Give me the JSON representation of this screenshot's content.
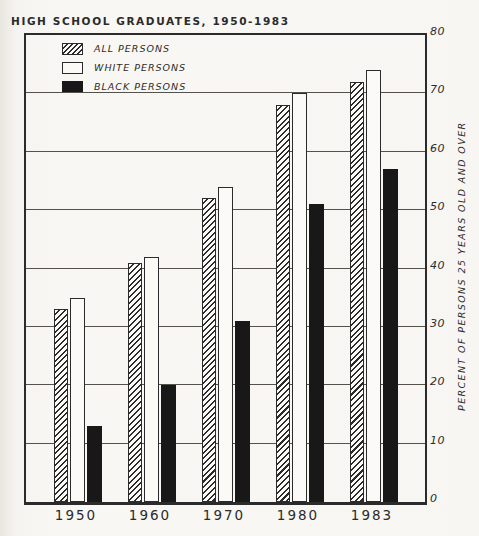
{
  "title": "HIGH SCHOOL GRADUATES, 1950-1983",
  "y_axis": {
    "label": "PERCENT OF PERSONS 25 YEARS OLD AND OVER",
    "ticks": [
      0,
      10,
      20,
      30,
      40,
      50,
      60,
      70,
      80
    ]
  },
  "x_axis": {
    "labels": [
      "1950",
      "1960",
      "1970",
      "1980",
      "1983"
    ]
  },
  "chart_data": {
    "type": "bar",
    "title": "HIGH SCHOOL GRADUATES, 1950-1983",
    "categories": [
      "1950",
      "1960",
      "1970",
      "1980",
      "1983"
    ],
    "series": [
      {
        "name": "ALL PERSONS",
        "style": "hatched",
        "values": [
          33,
          41,
          52,
          68,
          72
        ]
      },
      {
        "name": "WHITE PERSONS",
        "style": "white",
        "values": [
          35,
          42,
          54,
          70,
          74
        ]
      },
      {
        "name": "BLACK PERSONS",
        "style": "black",
        "values": [
          13,
          20,
          31,
          51,
          57
        ]
      }
    ],
    "xlabel": "",
    "ylabel": "PERCENT OF PERSONS 25 YEARS OLD AND OVER",
    "ylim": [
      0,
      80
    ],
    "ytick_step": 10,
    "grid": true,
    "legend_position": "top-left"
  },
  "colors": {
    "ink": "#2b2b2b",
    "paper": "#f7f6f2",
    "bar_white_fill": "#fbfaf7",
    "bar_black_fill": "#181818"
  }
}
